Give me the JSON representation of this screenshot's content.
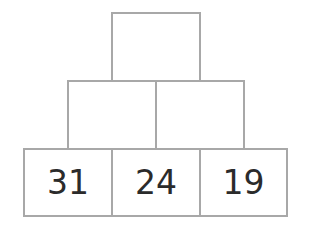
{
  "pyramid": {
    "top": [
      ""
    ],
    "middle": [
      "",
      ""
    ],
    "bottom": [
      "31",
      "24",
      "19"
    ],
    "border_color": "#a8a8a8",
    "text_color": "#2b2b2b"
  }
}
